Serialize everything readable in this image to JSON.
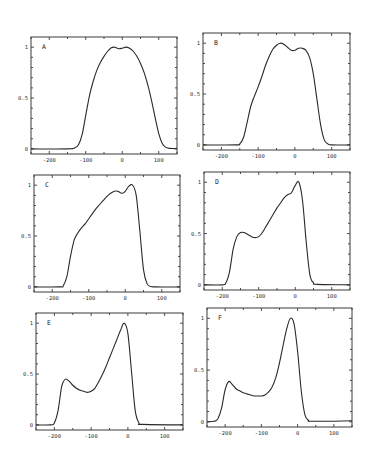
{
  "figure": {
    "panel_count": 6,
    "layout": "3 rows x 2 columns"
  },
  "chart_data": [
    {
      "type": "line",
      "panel": "A",
      "xlim": [
        -250,
        150
      ],
      "ylim": [
        -0.05,
        1.1
      ],
      "xticks": [
        -200,
        -100,
        0,
        100
      ],
      "yticks": [
        0,
        0.5,
        1
      ],
      "ytick_labels": [
        "0",
        "0.5",
        "1"
      ],
      "xtick_labels": [
        "-200",
        "-100",
        "0",
        "100"
      ],
      "grid": false,
      "series": [
        {
          "name": "A",
          "x": [
            -250,
            -150,
            -130,
            -120,
            -110,
            -100,
            -90,
            -80,
            -70,
            -60,
            -50,
            -40,
            -30,
            -20,
            -10,
            0,
            10,
            20,
            30,
            40,
            50,
            60,
            70,
            80,
            90,
            100,
            110,
            120,
            130,
            150
          ],
          "y": [
            0,
            0,
            0.01,
            0.04,
            0.14,
            0.33,
            0.52,
            0.66,
            0.77,
            0.85,
            0.91,
            0.96,
            0.995,
            1.0,
            0.985,
            0.99,
            1.0,
            0.99,
            0.96,
            0.91,
            0.84,
            0.75,
            0.63,
            0.48,
            0.31,
            0.15,
            0.05,
            0.015,
            0.005,
            0.005
          ]
        }
      ]
    },
    {
      "type": "line",
      "panel": "B",
      "xlim": [
        -250,
        150
      ],
      "ylim": [
        -0.05,
        1.1
      ],
      "xticks": [
        -200,
        -100,
        0,
        100
      ],
      "yticks": [
        0,
        0.5,
        1
      ],
      "ytick_labels": [
        "0",
        "0.5",
        "1"
      ],
      "xtick_labels": [
        "-200",
        "-100",
        "0",
        "100"
      ],
      "grid": false,
      "series": [
        {
          "name": "B",
          "x": [
            -250,
            -160,
            -150,
            -140,
            -130,
            -120,
            -110,
            -100,
            -90,
            -80,
            -70,
            -60,
            -50,
            -40,
            -30,
            -20,
            -10,
            0,
            10,
            20,
            30,
            40,
            50,
            60,
            70,
            80,
            90,
            100,
            150
          ],
          "y": [
            0,
            0,
            0.01,
            0.07,
            0.22,
            0.38,
            0.48,
            0.57,
            0.67,
            0.78,
            0.87,
            0.94,
            0.98,
            1.0,
            0.99,
            0.96,
            0.93,
            0.93,
            0.95,
            0.95,
            0.93,
            0.86,
            0.7,
            0.45,
            0.2,
            0.05,
            0.01,
            0.0,
            0.0
          ]
        }
      ]
    },
    {
      "type": "line",
      "panel": "C",
      "xlim": [
        -250,
        150
      ],
      "ylim": [
        -0.05,
        1.1
      ],
      "xticks": [
        -200,
        -100,
        0,
        100
      ],
      "yticks": [
        0,
        0.5,
        1
      ],
      "ytick_labels": [
        "0",
        "0.5",
        "1"
      ],
      "xtick_labels": [
        "-200",
        "-100",
        "0",
        "100"
      ],
      "grid": false,
      "series": [
        {
          "name": "C",
          "x": [
            -250,
            -180,
            -170,
            -160,
            -150,
            -140,
            -130,
            -120,
            -110,
            -100,
            -90,
            -80,
            -70,
            -60,
            -50,
            -40,
            -30,
            -20,
            -10,
            0,
            10,
            20,
            30,
            40,
            50,
            60,
            70,
            80,
            150
          ],
          "y": [
            0,
            0,
            0.01,
            0.1,
            0.3,
            0.46,
            0.53,
            0.58,
            0.62,
            0.67,
            0.72,
            0.77,
            0.81,
            0.85,
            0.89,
            0.92,
            0.94,
            0.94,
            0.92,
            0.94,
            0.99,
            1.0,
            0.9,
            0.55,
            0.17,
            0.03,
            0.005,
            0.0,
            0.0
          ]
        }
      ]
    },
    {
      "type": "line",
      "panel": "D",
      "xlim": [
        -250,
        150
      ],
      "ylim": [
        -0.05,
        1.1
      ],
      "xticks": [
        -200,
        -100,
        0,
        100
      ],
      "yticks": [
        0,
        0.5,
        1
      ],
      "ytick_labels": [
        "0",
        "0.5",
        "1"
      ],
      "xtick_labels": [
        "-200",
        "-100",
        "0",
        "100"
      ],
      "grid": false,
      "series": [
        {
          "name": "D",
          "x": [
            -250,
            -200,
            -190,
            -180,
            -170,
            -160,
            -150,
            -140,
            -130,
            -120,
            -110,
            -100,
            -90,
            -80,
            -70,
            -60,
            -50,
            -40,
            -30,
            -20,
            -10,
            0,
            10,
            20,
            30,
            40,
            50,
            60,
            150
          ],
          "y": [
            0,
            0,
            0.02,
            0.13,
            0.35,
            0.47,
            0.51,
            0.51,
            0.49,
            0.47,
            0.46,
            0.47,
            0.51,
            0.57,
            0.63,
            0.69,
            0.75,
            0.8,
            0.85,
            0.88,
            0.9,
            0.97,
            1.0,
            0.82,
            0.42,
            0.1,
            0.02,
            0.005,
            0.0
          ]
        }
      ]
    },
    {
      "type": "line",
      "panel": "E",
      "xlim": [
        -250,
        150
      ],
      "ylim": [
        -0.05,
        1.1
      ],
      "xticks": [
        -200,
        -100,
        0,
        100
      ],
      "yticks": [
        0,
        0.5,
        1
      ],
      "ytick_labels": [
        "0",
        "0.5",
        "1"
      ],
      "xtick_labels": [
        "-200",
        "-100",
        "0",
        "100"
      ],
      "grid": false,
      "series": [
        {
          "name": "E",
          "x": [
            -250,
            -210,
            -200,
            -190,
            -180,
            -170,
            -160,
            -150,
            -140,
            -130,
            -120,
            -110,
            -100,
            -90,
            -80,
            -70,
            -60,
            -50,
            -40,
            -30,
            -20,
            -10,
            0,
            10,
            20,
            30,
            40,
            150
          ],
          "y": [
            0,
            0,
            0.02,
            0.14,
            0.38,
            0.45,
            0.43,
            0.39,
            0.36,
            0.34,
            0.33,
            0.32,
            0.33,
            0.36,
            0.42,
            0.49,
            0.57,
            0.66,
            0.75,
            0.84,
            0.93,
            1.0,
            0.9,
            0.52,
            0.14,
            0.02,
            0.005,
            0.0
          ]
        }
      ]
    },
    {
      "type": "line",
      "panel": "F",
      "xlim": [
        -250,
        150
      ],
      "ylim": [
        -0.05,
        1.1
      ],
      "xticks": [
        -200,
        -100,
        0,
        100
      ],
      "yticks": [
        0,
        0.5,
        1
      ],
      "ytick_labels": [
        "0",
        "0.5",
        "1"
      ],
      "xtick_labels": [
        "-200",
        "-100",
        "0",
        "100"
      ],
      "grid": false,
      "series": [
        {
          "name": "F",
          "x": [
            -250,
            -230,
            -220,
            -210,
            -200,
            -190,
            -180,
            -170,
            -160,
            -150,
            -140,
            -130,
            -120,
            -110,
            -100,
            -90,
            -80,
            -70,
            -60,
            -50,
            -40,
            -30,
            -20,
            -10,
            0,
            10,
            20,
            30,
            40,
            150
          ],
          "y": [
            0,
            0.005,
            0.03,
            0.13,
            0.31,
            0.39,
            0.36,
            0.32,
            0.3,
            0.28,
            0.27,
            0.26,
            0.25,
            0.25,
            0.25,
            0.26,
            0.29,
            0.34,
            0.43,
            0.57,
            0.74,
            0.9,
            1.0,
            0.95,
            0.68,
            0.3,
            0.07,
            0.015,
            0.005,
            0.01
          ]
        }
      ]
    }
  ],
  "panels": [
    {
      "label": "A",
      "frame": [
        31,
        37,
        177,
        154
      ]
    },
    {
      "label": "B",
      "frame": [
        203,
        33,
        350,
        150
      ]
    },
    {
      "label": "C",
      "frame": [
        34,
        175,
        180,
        292
      ]
    },
    {
      "label": "D",
      "frame": [
        204,
        172,
        350,
        290
      ]
    },
    {
      "label": "E",
      "frame": [
        36,
        313,
        183,
        430
      ]
    },
    {
      "label": "F",
      "frame": [
        207,
        308,
        352,
        427
      ]
    }
  ]
}
